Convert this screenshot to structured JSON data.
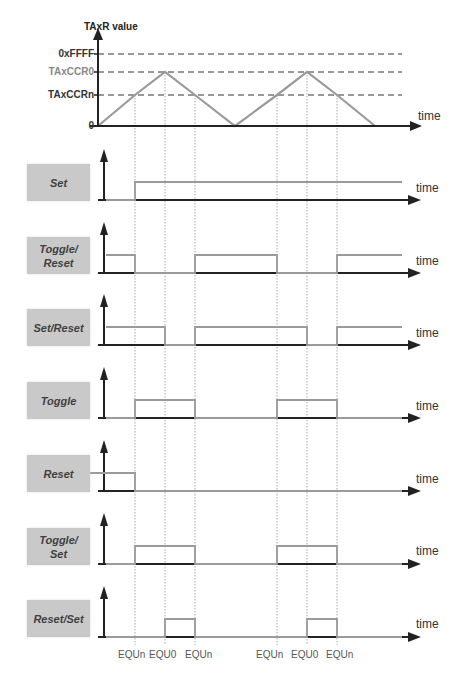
{
  "figure": {
    "type": "timer-output-modes-up-down",
    "top_plot": {
      "y_axis_title": "TAxR value",
      "x_axis_label": "time",
      "levels": [
        {
          "label": "0xFFFF",
          "value": 65535,
          "style": "dark"
        },
        {
          "label": "TAxCCR0",
          "value": "CCR0",
          "style": "gray"
        },
        {
          "label": "TAxCCRn",
          "value": "CCRn",
          "style": "dark"
        },
        {
          "label": "0",
          "value": 0,
          "style": "dark"
        }
      ],
      "waveform": "triangle (up/down count mode), two periods"
    },
    "rows": [
      {
        "mode": "Set",
        "line1": "Set",
        "line2": "",
        "x_label": "time"
      },
      {
        "mode": "Toggle/Reset",
        "line1": "Toggle/",
        "line2": "Reset",
        "x_label": "time"
      },
      {
        "mode": "Set/Reset",
        "line1": "Set/Reset",
        "line2": "",
        "x_label": "time"
      },
      {
        "mode": "Toggle",
        "line1": "Toggle",
        "line2": "",
        "x_label": "time"
      },
      {
        "mode": "Reset",
        "line1": "Reset",
        "line2": "",
        "x_label": "time"
      },
      {
        "mode": "Toggle/Set",
        "line1": "Toggle/",
        "line2": "Set",
        "x_label": "time"
      },
      {
        "mode": "Reset/Set",
        "line1": "Reset/Set",
        "line2": "",
        "x_label": "time"
      }
    ],
    "event_labels": [
      "EQUn",
      "EQU0",
      "EQUn",
      "EQUn",
      "EQU0",
      "EQUn"
    ],
    "colors": {
      "axis": "#222222",
      "trace": "#9a9a9a",
      "dashed": "#777777",
      "guide": "#aaaaaa",
      "box": "#c9c9c9"
    }
  },
  "chart_data": {
    "type": "line",
    "title": "TAxR value",
    "xlabel": "time",
    "ylabel": "TAxR value",
    "x_events": [
      "0",
      "EQUn",
      "EQU0",
      "EQUn",
      "0",
      "EQUn",
      "EQU0",
      "EQUn",
      "0"
    ],
    "series": [
      {
        "name": "TAxR",
        "x": [
          0,
          1,
          2,
          3,
          4,
          5,
          6,
          7,
          8
        ],
        "values": [
          "0",
          "CCRn",
          "CCR0",
          "CCRn",
          "0",
          "CCRn",
          "CCR0",
          "CCRn",
          "0"
        ]
      },
      {
        "name": "Set",
        "levels": [
          0,
          1,
          1,
          1,
          1,
          1,
          1,
          1,
          1
        ]
      },
      {
        "name": "Toggle/Reset",
        "levels": [
          1,
          0,
          0,
          1,
          1,
          0,
          0,
          1,
          1
        ]
      },
      {
        "name": "Set/Reset",
        "levels": [
          1,
          1,
          0,
          1,
          1,
          1,
          0,
          1,
          1
        ]
      },
      {
        "name": "Toggle",
        "levels": [
          0,
          1,
          1,
          0,
          0,
          1,
          1,
          0,
          0
        ]
      },
      {
        "name": "Reset",
        "levels": [
          1,
          0,
          0,
          0,
          0,
          0,
          0,
          0,
          0
        ]
      },
      {
        "name": "Toggle/Set",
        "levels": [
          0,
          1,
          1,
          0,
          0,
          1,
          1,
          0,
          0
        ]
      },
      {
        "name": "Reset/Set",
        "levels": [
          0,
          0,
          1,
          0,
          0,
          0,
          1,
          0,
          0
        ]
      }
    ],
    "reference_lines": [
      "0xFFFF",
      "TAxCCR0",
      "TAxCCRn"
    ],
    "grid": false
  }
}
